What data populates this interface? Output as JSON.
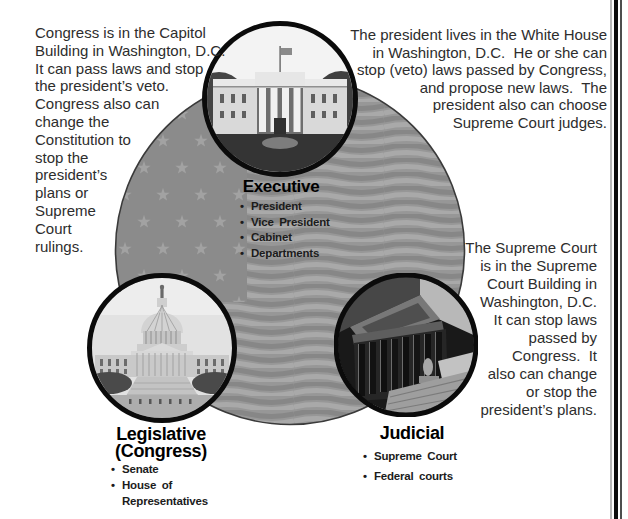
{
  "notes": {
    "congress": "Congress is in the Capitol\nBuilding in Washington, D.C.\nIt can pass laws and stop\nthe president’s veto.\nCongress also can\nchange the\nConstitution to\nstop the\npresident’s\nplans or\nSupreme\nCourt\nrulings.",
    "president": "The president lives in the White House\nin Washington, D.C.  He or she can\nstop (veto) laws passed by Congress,\nand propose new laws.  The\npresident also can choose\nSupreme Court judges.",
    "supreme_court": "The Supreme Court\nis in the Supreme\nCourt Building in\nWashington, D.C.\nIt can stop laws\npassed by\nCongress.  It\nalso can change\nor stop the\npresident’s plans."
  },
  "branches": {
    "executive": {
      "label": "Executive",
      "items": [
        "President",
        "Vice President",
        "Cabinet",
        "Departments"
      ],
      "photo": "white-house"
    },
    "legislative": {
      "label": "Legislative\n(Congress)",
      "items": [
        "Senate",
        "House of\nRepresentatives"
      ],
      "photo": "us-capitol"
    },
    "judicial": {
      "label": "Judicial",
      "items": [
        "Supreme Court",
        "Federal courts"
      ],
      "photo": "supreme-court-building"
    }
  },
  "colors": {
    "page_bg": "#ffffff",
    "flag_circle_base": "#999999",
    "flag_canton": "#8b8b8b",
    "flag_star": "#a2a2a2",
    "flag_wave_dark": "#878787",
    "flag_wave_light": "#a9a9a9",
    "circle_border": "#0b0b0b",
    "body_text": "#2d2d2d",
    "heading_text": "#000000"
  }
}
